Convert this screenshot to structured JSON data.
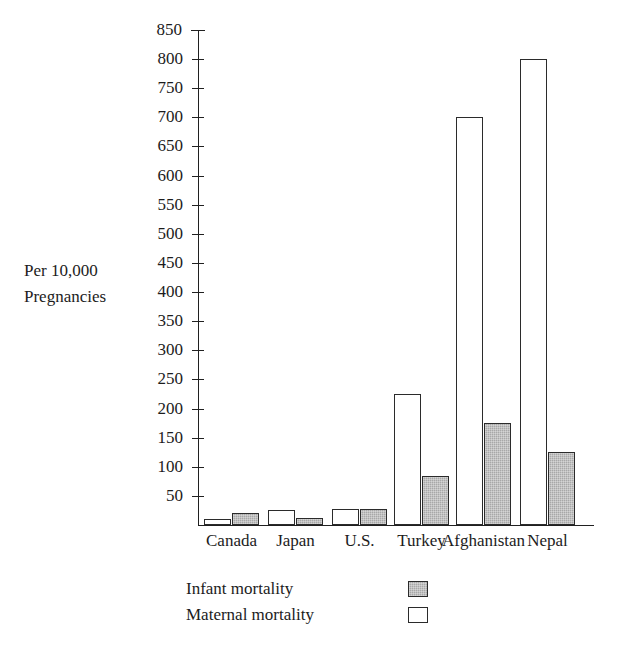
{
  "chart_data": {
    "type": "bar",
    "title": "",
    "xlabel": "",
    "ylabel": "Per 10,000\nPregnancies",
    "categories": [
      "Canada",
      "Japan",
      "U.S.",
      "Turkey",
      "Afghanistan",
      "Nepal"
    ],
    "series": [
      {
        "name": "Maternal mortality",
        "color": "#ffffff",
        "values": [
          10,
          25,
          28,
          225,
          700,
          800
        ]
      },
      {
        "name": "Infant mortality",
        "color": "#a8a8a8",
        "values": [
          20,
          12,
          28,
          85,
          175,
          125
        ]
      }
    ],
    "ylim": [
      0,
      850
    ],
    "ytick_step": 50,
    "yticks": [
      850,
      800,
      750,
      700,
      650,
      600,
      550,
      500,
      450,
      400,
      350,
      300,
      250,
      200,
      150,
      100,
      50
    ],
    "grid": false,
    "legend_position": "bottom-center",
    "legend": [
      {
        "label": "Infant mortality",
        "swatch": "gray-filled-square"
      },
      {
        "label": "Maternal mortality",
        "swatch": "white-outline-square"
      }
    ],
    "series_order_in_group": [
      "Maternal mortality",
      "Infant mortality"
    ]
  }
}
